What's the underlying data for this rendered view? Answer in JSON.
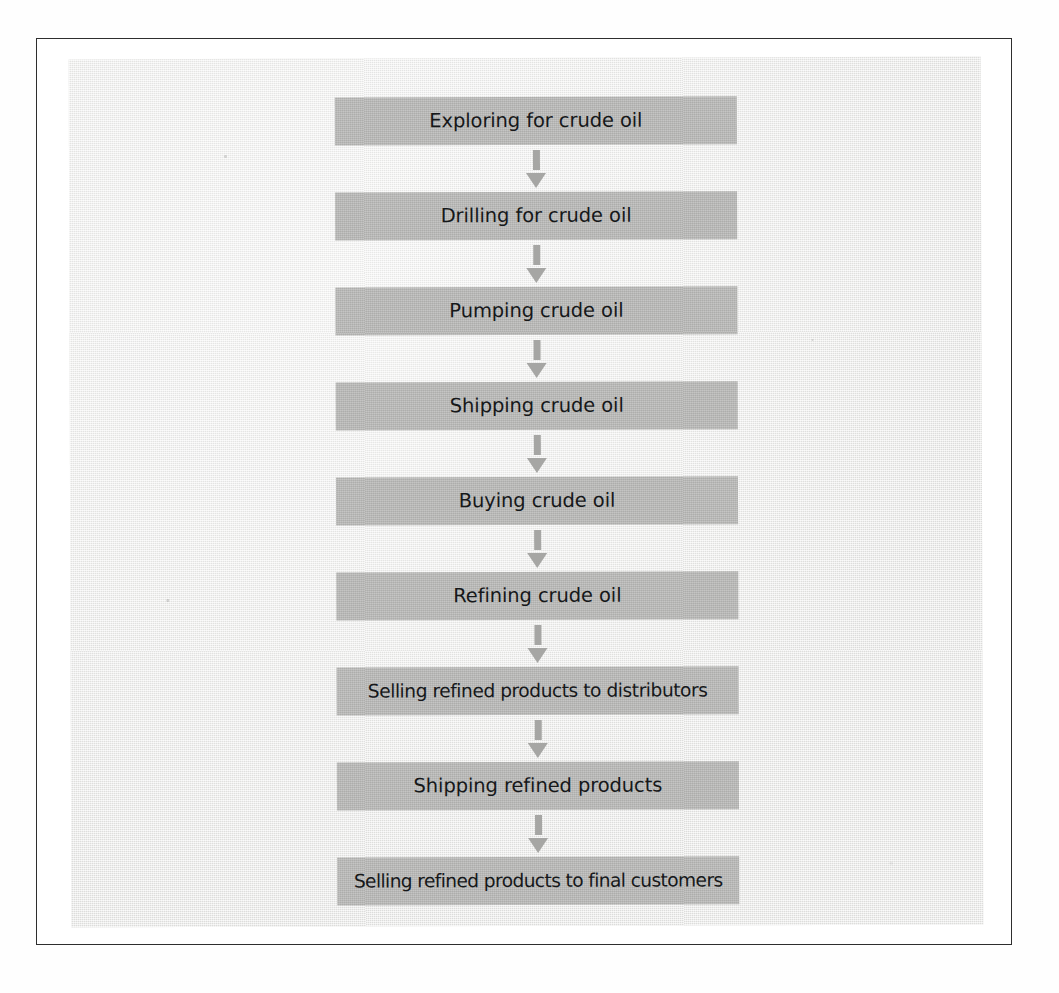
{
  "figure": {
    "type": "flowchart",
    "orientation": "vertical",
    "title": "",
    "colors": {
      "page_background": "#ffffff",
      "frame_border": "#2e2e2e",
      "panel_background": "#e9e9e7",
      "step_fill": "#b9b9b7",
      "arrow_fill": "#a6a6a4",
      "label_text": "#16181a"
    },
    "step_count": 9,
    "connector_count": 8,
    "connector_icon": "down-arrow-icon",
    "steps": [
      {
        "index": 1,
        "label": "Exploring for crude oil"
      },
      {
        "index": 2,
        "label": "Drilling for crude oil"
      },
      {
        "index": 3,
        "label": "Pumping crude oil"
      },
      {
        "index": 4,
        "label": "Shipping crude oil"
      },
      {
        "index": 5,
        "label": "Buying crude oil"
      },
      {
        "index": 6,
        "label": "Refining crude oil"
      },
      {
        "index": 7,
        "label": "Selling refined products to distributors"
      },
      {
        "index": 8,
        "label": "Shipping refined products"
      },
      {
        "index": 9,
        "label": "Selling refined products to final customers"
      }
    ]
  }
}
